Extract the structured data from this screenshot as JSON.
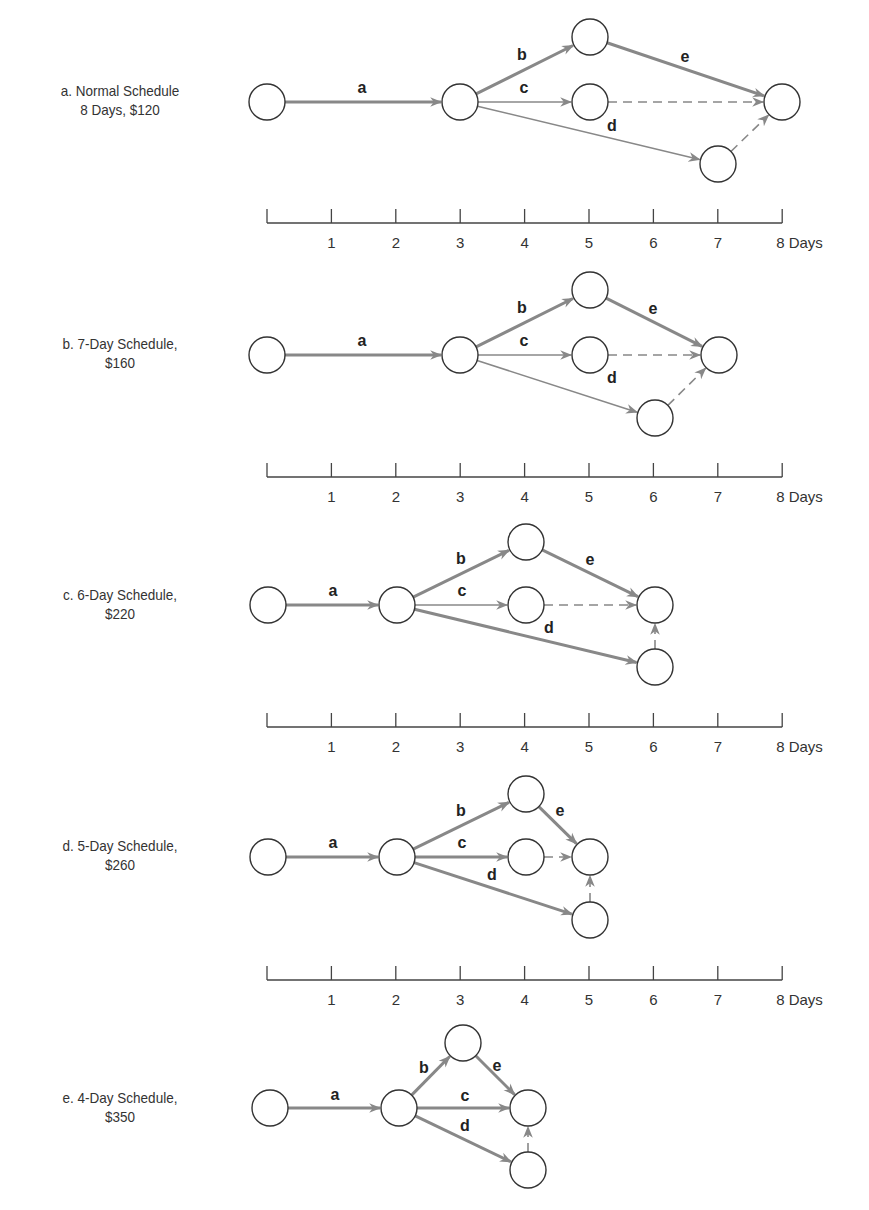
{
  "figure": {
    "node_radius": 18,
    "colors": {
      "node_stroke": "#333333",
      "arrow": "#888888",
      "text": "#222222"
    },
    "axis": {
      "ticks": [
        "1",
        "2",
        "3",
        "4",
        "5",
        "6",
        "7",
        "8 Days"
      ],
      "x0": 267,
      "day_px": 64.4
    }
  },
  "panels": [
    {
      "id": "a",
      "caption_line1": "a. Normal Schedule",
      "caption_line2": "8 Days, $120",
      "duration_days": 8,
      "cost": "$120",
      "caption_y": 81,
      "axis_y": 223,
      "nodes": [
        [
          267,
          102
        ],
        [
          460,
          102
        ],
        [
          590,
          37
        ],
        [
          590,
          102
        ],
        [
          718,
          164
        ],
        [
          782,
          102
        ]
      ],
      "activities": [
        {
          "label": "a",
          "from": 0,
          "to": 1,
          "type": "crit",
          "lx": 362,
          "ly": 93
        },
        {
          "label": "b",
          "from": 1,
          "to": 2,
          "type": "crit",
          "lx": 522,
          "ly": 60
        },
        {
          "label": "c",
          "from": 1,
          "to": 3,
          "type": "norm",
          "lx": 524,
          "ly": 93
        },
        {
          "label": "d",
          "from": 1,
          "to": 4,
          "type": "norm",
          "lx": 612,
          "ly": 131
        },
        {
          "label": "e",
          "from": 2,
          "to": 5,
          "type": "crit",
          "lx": 685,
          "ly": 62
        },
        {
          "label": "",
          "from": 3,
          "to": 5,
          "type": "dummy"
        },
        {
          "label": "",
          "from": 4,
          "to": 5,
          "type": "dummy"
        }
      ]
    },
    {
      "id": "b",
      "caption_line1": "b. 7-Day Schedule,",
      "caption_line2": "$160",
      "duration_days": 7,
      "cost": "$160",
      "caption_y": 334,
      "axis_y": 477,
      "nodes": [
        [
          267,
          355
        ],
        [
          460,
          355
        ],
        [
          590,
          290
        ],
        [
          590,
          355
        ],
        [
          655,
          418
        ],
        [
          719,
          355
        ]
      ],
      "activities": [
        {
          "label": "a",
          "from": 0,
          "to": 1,
          "type": "crit",
          "lx": 362,
          "ly": 346
        },
        {
          "label": "b",
          "from": 1,
          "to": 2,
          "type": "crit",
          "lx": 522,
          "ly": 313
        },
        {
          "label": "c",
          "from": 1,
          "to": 3,
          "type": "norm",
          "lx": 524,
          "ly": 346
        },
        {
          "label": "d",
          "from": 1,
          "to": 4,
          "type": "norm",
          "lx": 612,
          "ly": 383
        },
        {
          "label": "e",
          "from": 2,
          "to": 5,
          "type": "crit",
          "lx": 653,
          "ly": 314
        },
        {
          "label": "",
          "from": 3,
          "to": 5,
          "type": "dummy"
        },
        {
          "label": "",
          "from": 4,
          "to": 5,
          "type": "dummy"
        }
      ]
    },
    {
      "id": "c",
      "caption_line1": "c. 6-Day Schedule,",
      "caption_line2": "$220",
      "duration_days": 6,
      "cost": "$220",
      "caption_y": 585,
      "axis_y": 727,
      "nodes": [
        [
          268,
          605
        ],
        [
          397,
          605
        ],
        [
          526,
          542
        ],
        [
          526,
          605
        ],
        [
          655,
          667
        ],
        [
          655,
          605
        ]
      ],
      "activities": [
        {
          "label": "a",
          "from": 0,
          "to": 1,
          "type": "crit",
          "lx": 333,
          "ly": 596
        },
        {
          "label": "b",
          "from": 1,
          "to": 2,
          "type": "crit",
          "lx": 461,
          "ly": 564
        },
        {
          "label": "c",
          "from": 1,
          "to": 3,
          "type": "norm",
          "lx": 462,
          "ly": 596
        },
        {
          "label": "d",
          "from": 1,
          "to": 4,
          "type": "crit",
          "lx": 549,
          "ly": 633
        },
        {
          "label": "e",
          "from": 2,
          "to": 5,
          "type": "crit",
          "lx": 590,
          "ly": 565
        },
        {
          "label": "",
          "from": 3,
          "to": 5,
          "type": "dummy"
        },
        {
          "label": "",
          "from": 4,
          "to": 5,
          "type": "dummy"
        }
      ]
    },
    {
      "id": "d",
      "caption_line1": "d. 5-Day Schedule,",
      "caption_line2": "$260",
      "duration_days": 5,
      "cost": "$260",
      "caption_y": 836,
      "axis_y": 980,
      "nodes": [
        [
          268,
          857
        ],
        [
          397,
          857
        ],
        [
          526,
          794
        ],
        [
          526,
          857
        ],
        [
          590,
          920
        ],
        [
          590,
          857
        ]
      ],
      "activities": [
        {
          "label": "a",
          "from": 0,
          "to": 1,
          "type": "crit",
          "lx": 333,
          "ly": 848
        },
        {
          "label": "b",
          "from": 1,
          "to": 2,
          "type": "crit",
          "lx": 461,
          "ly": 816
        },
        {
          "label": "c",
          "from": 1,
          "to": 3,
          "type": "crit",
          "lx": 462,
          "ly": 848
        },
        {
          "label": "d",
          "from": 1,
          "to": 4,
          "type": "crit",
          "lx": 492,
          "ly": 880
        },
        {
          "label": "e",
          "from": 2,
          "to": 5,
          "type": "crit",
          "lx": 560,
          "ly": 816
        },
        {
          "label": "",
          "from": 3,
          "to": 5,
          "type": "dummy"
        },
        {
          "label": "",
          "from": 4,
          "to": 5,
          "type": "dummy"
        }
      ]
    },
    {
      "id": "e",
      "caption_line1": "e. 4-Day Schedule,",
      "caption_line2": "$350",
      "duration_days": 4,
      "cost": "$350",
      "caption_y": 1088,
      "axis_y": null,
      "nodes": [
        [
          270,
          1108
        ],
        [
          399,
          1108
        ],
        [
          463,
          1043
        ],
        [
          528,
          1108
        ],
        [
          528,
          1170
        ]
      ],
      "activities": [
        {
          "label": "a",
          "from": 0,
          "to": 1,
          "type": "crit",
          "lx": 335,
          "ly": 1100
        },
        {
          "label": "b",
          "from": 1,
          "to": 2,
          "type": "crit",
          "lx": 424,
          "ly": 1073
        },
        {
          "label": "c",
          "from": 1,
          "to": 3,
          "type": "crit",
          "lx": 465,
          "ly": 1101
        },
        {
          "label": "d",
          "from": 1,
          "to": 4,
          "type": "crit",
          "lx": 465,
          "ly": 1131
        },
        {
          "label": "e",
          "from": 2,
          "to": 3,
          "type": "crit",
          "lx": 497,
          "ly": 1071
        },
        {
          "label": "",
          "from": 4,
          "to": 3,
          "type": "dummy"
        }
      ]
    }
  ]
}
